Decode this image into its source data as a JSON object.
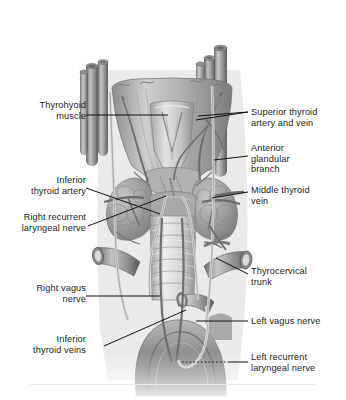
{
  "figure": {
    "background_color": "#ffffff",
    "text_color": "#1b1b1b",
    "style": "grayscale medical illustration"
  },
  "labels": {
    "left": [
      {
        "id": "thyrohyoid-muscle",
        "text": "Thyrohyoid\nmuscle",
        "x": 20,
        "y": 100
      },
      {
        "id": "inferior-thyroid-artery",
        "text": "Inferior\nthyroid artery",
        "x": 8,
        "y": 175
      },
      {
        "id": "right-recurrent-laryngeal",
        "text": "Right recurrent\nlaryngeal nerve",
        "x": 6,
        "y": 212
      },
      {
        "id": "right-vagus-nerve",
        "text": "Right vagus\nnerve",
        "x": 22,
        "y": 283
      },
      {
        "id": "inferior-thyroid-veins",
        "text": "Inferior\nthyroid veins",
        "x": 18,
        "y": 334
      }
    ],
    "right": [
      {
        "id": "superior-thyroid-artery-vein",
        "text": "Superior thyroid\nartery and vein",
        "x": 251,
        "y": 107
      },
      {
        "id": "anterior-glandular-branch",
        "text": "Anterior\nglandular\nbranch",
        "x": 251,
        "y": 143
      },
      {
        "id": "middle-thyroid-vein",
        "text": "Middle thyroid\nvein",
        "x": 251,
        "y": 185
      },
      {
        "id": "thyrocervical-trunk",
        "text": "Thyrocervical\ntrunk",
        "x": 251,
        "y": 266
      },
      {
        "id": "left-vagus-nerve",
        "text": "Left vagus nerve",
        "x": 251,
        "y": 316
      },
      {
        "id": "left-recurrent-laryngeal",
        "text": "Left recurrent\nlaryngeal nerve",
        "x": 251,
        "y": 352
      }
    ]
  },
  "structures": [
    {
      "name": "thyroid-cartilage",
      "description": "Laryngeal prominence, upper midline shield"
    },
    {
      "name": "thyrohyoid-muscle",
      "description": "Flat strap muscle over the thyroid cartilage"
    },
    {
      "name": "thyroid-gland-right",
      "description": "Right lobe, lobulated mass beside trachea"
    },
    {
      "name": "thyroid-gland-left",
      "description": "Left lobe, lobulated mass beside trachea"
    },
    {
      "name": "thyroid-isthmus",
      "description": "Band connecting the two lobes across trachea"
    },
    {
      "name": "trachea",
      "description": "Midline tube with cartilage rings"
    },
    {
      "name": "common-carotid-right",
      "description": "Cut vessel bundle, upper left of image"
    },
    {
      "name": "common-carotid-left",
      "description": "Cut vessel bundle, upper right of image"
    },
    {
      "name": "subclavian-artery",
      "description": "Cut vessel with open lumen, lower right"
    },
    {
      "name": "brachiocephalic-vein",
      "description": "Cut vessel with open lumen, lower left"
    },
    {
      "name": "aortic-arch",
      "description": "Large curved vessel at base of figure"
    }
  ],
  "leaders": {
    "style": "thin solid black lines; aortic-arch leader is dotted",
    "color": "#111111"
  }
}
